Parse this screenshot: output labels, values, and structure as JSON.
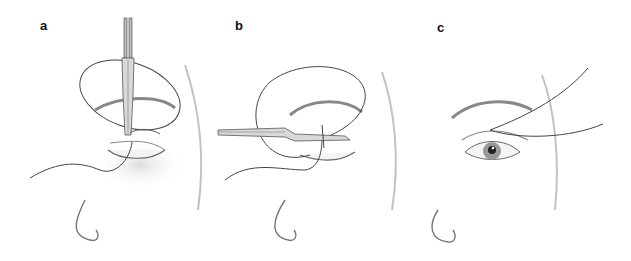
{
  "figure": {
    "panels": [
      {
        "label": "a",
        "description": "Needle holder held vertically passing suture through upper eyelid; suture loop encircles eye"
      },
      {
        "label": "b",
        "description": "Needle holder held horizontally passing suture through eyelid margin; suture loop around eye"
      },
      {
        "label": "c",
        "description": "Completed suture with two thread ends exiting laterally above open eye"
      }
    ]
  }
}
